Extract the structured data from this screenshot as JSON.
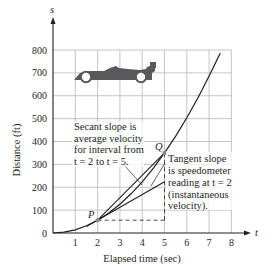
{
  "chart_data": {
    "type": "line",
    "title": "",
    "xlabel": "Elapsed time (sec)",
    "ylabel": "Distance (ft)",
    "x_axis_var": "t",
    "y_axis_var": "s",
    "xlim": [
      0,
      8
    ],
    "ylim": [
      0,
      800
    ],
    "x_ticks": [
      1,
      2,
      3,
      4,
      5,
      6,
      7,
      8
    ],
    "y_ticks": [
      0,
      100,
      200,
      300,
      400,
      500,
      600,
      700,
      800
    ],
    "grid": true,
    "series": [
      {
        "name": "distance curve s(t)",
        "x": [
          0,
          0.5,
          1,
          1.5,
          2,
          2.5,
          3,
          3.5,
          4,
          4.5,
          5,
          5.5,
          6,
          6.5,
          7,
          7.5
        ],
        "values": [
          0,
          3.5,
          14,
          31.5,
          56,
          87.5,
          126,
          171.5,
          224,
          283.5,
          350,
          423.5,
          504,
          591.5,
          686,
          787.5
        ]
      },
      {
        "name": "secant line P to Q",
        "x": [
          2,
          5
        ],
        "values": [
          56,
          350
        ]
      },
      {
        "name": "tangent line at P",
        "x": [
          1.5,
          5
        ],
        "values": [
          28,
          224
        ]
      }
    ],
    "points": [
      {
        "label": "P",
        "t": 2,
        "s": 56
      },
      {
        "label": "Q",
        "t": 5,
        "s": 350
      }
    ],
    "annotations": [
      {
        "lines": [
          "Secant slope is",
          "average velocity",
          "for interval from",
          "t = 2 to t = 5."
        ]
      },
      {
        "lines": [
          "Tangent slope",
          "is speedometer",
          "reading at t = 2",
          "(instantaneous",
          "velocity)."
        ]
      }
    ],
    "decoration": "race car silhouette near top-left of plot"
  },
  "labels": {
    "s_axis": "s",
    "t_axis": "t",
    "xlabel": "Elapsed time (sec)",
    "ylabel": "Distance (ft)",
    "P": "P",
    "Q": "Q",
    "secant_text": [
      "Secant slope is",
      "average velocity",
      "for interval from",
      "t = 2 to t = 5."
    ],
    "tangent_text": [
      "Tangent slope",
      "is speedometer",
      "reading at t = 2",
      "(instantaneous",
      "velocity)."
    ],
    "x_ticks": [
      "1",
      "2",
      "3",
      "4",
      "5",
      "6",
      "7",
      "8"
    ],
    "y_ticks": [
      "0",
      "100",
      "200",
      "300",
      "400",
      "500",
      "600",
      "700",
      "800"
    ]
  },
  "colors": {
    "curve": "#231f20",
    "grid": "#b8b8b8",
    "car": "#58595b",
    "point": "#8a8a8a"
  }
}
